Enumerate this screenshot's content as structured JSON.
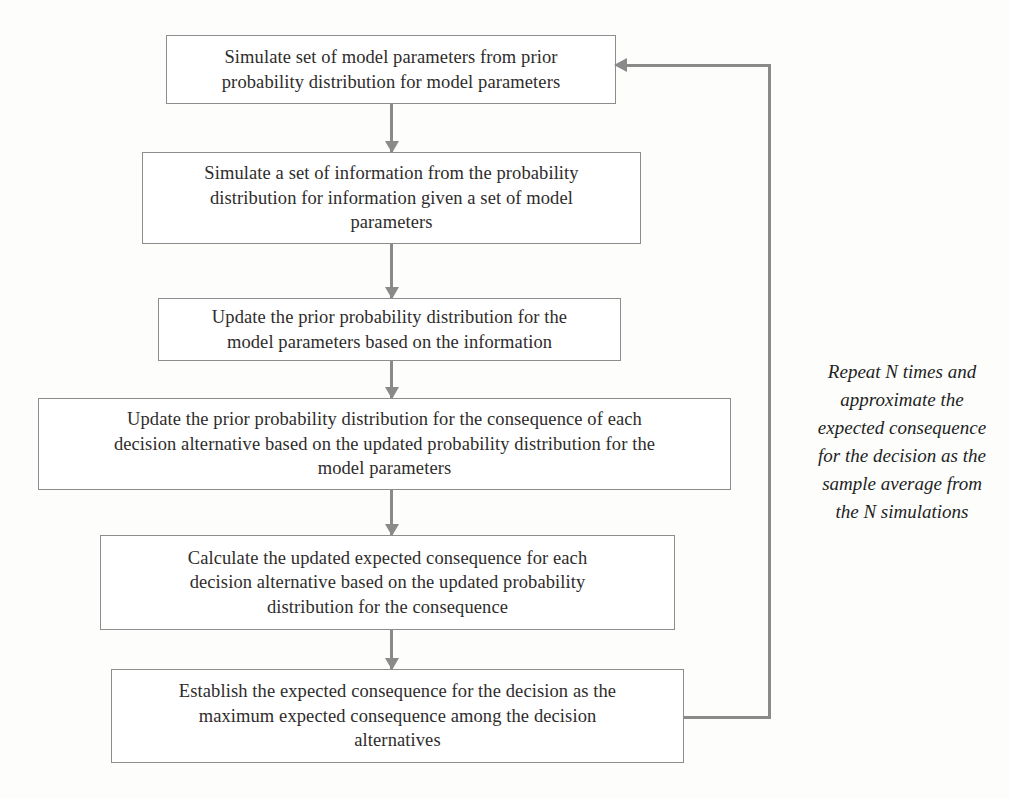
{
  "diagram": {
    "type": "flowchart",
    "orientation": "vertical-sequence-with-feedback-loop",
    "line_color": "#8a8a8a",
    "text_color": "#2e2c2b",
    "background_color": "#fdfdfc",
    "nodes": [
      {
        "id": "node1",
        "label": "Simulate set of model parameters from prior\nprobability distribution for model parameters"
      },
      {
        "id": "node2",
        "label": "Simulate a set of information from the probability\ndistribution for information given a set of model\nparameters"
      },
      {
        "id": "node3",
        "label": "Update the prior probability distribution for the\nmodel parameters based on the information"
      },
      {
        "id": "node4",
        "label": "Update the prior probability distribution for the consequence of each\ndecision alternative based on the updated probability distribution for the\nmodel parameters"
      },
      {
        "id": "node5",
        "label": "Calculate the updated expected consequence for each\ndecision alternative based on the updated probability\ndistribution for the consequence"
      },
      {
        "id": "node6",
        "label": "Establish the expected consequence for the decision as the\nmaximum expected consequence among the decision\nalternatives"
      }
    ],
    "edges": [
      {
        "id": "conn1",
        "from": "node1",
        "to": "node2",
        "kind": "arrow-down"
      },
      {
        "id": "conn2",
        "from": "node2",
        "to": "node3",
        "kind": "arrow-down"
      },
      {
        "id": "conn3",
        "from": "node3",
        "to": "node4",
        "kind": "arrow-down"
      },
      {
        "id": "conn4",
        "from": "node4",
        "to": "node5",
        "kind": "arrow-down"
      },
      {
        "id": "conn5",
        "from": "node5",
        "to": "node6",
        "kind": "arrow-down"
      },
      {
        "id": "loop",
        "from": "node6",
        "to": "node1",
        "kind": "feedback-loop-arrow"
      }
    ],
    "caption": "Repeat N times and\napproximate the\nexpected consequence\nfor the decision as the\nsample average from\nthe N simulations"
  }
}
